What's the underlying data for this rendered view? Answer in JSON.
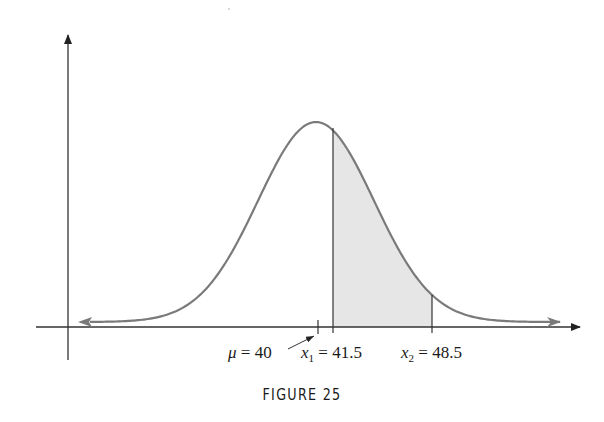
{
  "figure": {
    "caption": "FIGURE 25",
    "labels": {
      "mu": {
        "symbol": "μ",
        "eq": " = 40"
      },
      "x1": {
        "symbol": "x",
        "sub": "1",
        "eq": " = 41.5"
      },
      "x2": {
        "symbol": "x",
        "sub": "2",
        "eq": " = 48.5"
      }
    },
    "colors": {
      "curve": "#7a7a7a",
      "axes": "#333333",
      "shade": "#e6e6e6",
      "text": "#1a1a1a"
    }
  },
  "chart_data": {
    "type": "area",
    "title": "FIGURE 25",
    "distribution": "normal",
    "mean": 40,
    "shaded_interval": [
      41.5,
      48.5
    ],
    "annotations": [
      {
        "text": "μ = 40",
        "x": 40
      },
      {
        "text": "x1 = 41.5",
        "x": 41.5
      },
      {
        "text": "x2 = 48.5",
        "x": 48.5
      }
    ],
    "xlabel": "",
    "ylabel": "",
    "grid": false,
    "legend": null
  }
}
